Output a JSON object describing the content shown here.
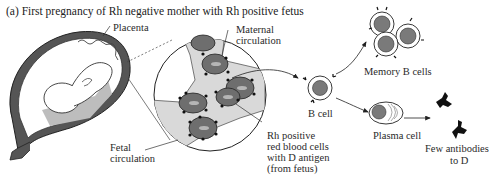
{
  "figure": {
    "title": "(a) First pregnancy of Rh negative mother with Rh positive fetus",
    "labels": {
      "placenta": "Placenta",
      "maternal_circulation": [
        "Maternal",
        "circulation"
      ],
      "fetal_circulation": [
        "Fetal",
        "circulation"
      ],
      "rh_cells": [
        "Rh positive",
        "red blood cells",
        "with D antigen",
        "(from fetus)"
      ],
      "b_cell": "B cell",
      "memory_b_cells": "Memory B cells",
      "plasma_cell": "Plasma cell",
      "antibodies": [
        "Few antibodies",
        "to D"
      ]
    },
    "colors": {
      "line": "#222222",
      "cell_fill": "#6e6e6e",
      "nucleus": "#7a7a7a",
      "plasma_region": "#d9d9d9",
      "antibody": "#111111"
    }
  }
}
